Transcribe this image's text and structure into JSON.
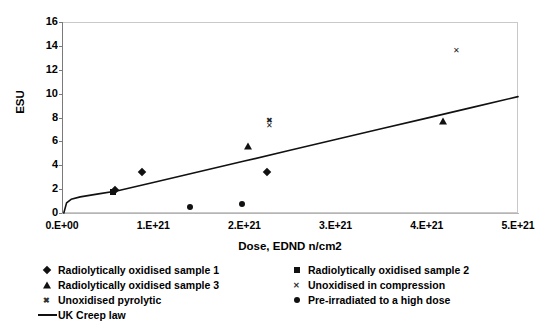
{
  "chart_data": {
    "type": "scatter",
    "title": "",
    "xlabel": "Dose, EDND n/cm2",
    "ylabel": "ESU",
    "xlim": [
      0,
      5e+21
    ],
    "ylim": [
      0,
      16
    ],
    "xticks": [
      "0.E+00",
      "1.E+21",
      "2.E+21",
      "3.E+21",
      "4.E+21",
      "5.E+21"
    ],
    "xtick_values": [
      0,
      1e+21,
      2e+21,
      3e+21,
      4e+21,
      5e+21
    ],
    "yticks": [
      "0",
      "2",
      "4",
      "6",
      "8",
      "10",
      "12",
      "14",
      "16"
    ],
    "ytick_values": [
      0,
      2,
      4,
      6,
      8,
      10,
      12,
      14,
      16
    ],
    "grid": false,
    "legend_position": "bottom",
    "series": [
      {
        "name": "Radiolytically oxidised sample 1",
        "marker": "diamond",
        "points": [
          {
            "x": 5.8e+20,
            "y": 1.95
          },
          {
            "x": 8.8e+20,
            "y": 3.45
          },
          {
            "x": 2.25e+21,
            "y": 3.45
          }
        ]
      },
      {
        "name": "Radiolytically oxidised sample 2",
        "marker": "square",
        "points": [
          {
            "x": 5.6e+20,
            "y": 1.8
          }
        ]
      },
      {
        "name": "Radiolytically oxidised sample 3",
        "marker": "triangle",
        "points": [
          {
            "x": 2.04e+21,
            "y": 5.6
          },
          {
            "x": 4.18e+21,
            "y": 7.7
          }
        ]
      },
      {
        "name": "Unoxidised in compression",
        "marker": "x-thin",
        "points": [
          {
            "x": 2.27e+21,
            "y": 7.35
          },
          {
            "x": 4.33e+21,
            "y": 13.65
          }
        ]
      },
      {
        "name": "Unoxidised pyrolytic",
        "marker": "x-bold",
        "points": [
          {
            "x": 2.27e+21,
            "y": 7.8
          }
        ]
      },
      {
        "name": "Pre-irradiated to a high dose",
        "marker": "circle",
        "points": [
          {
            "x": 1.4e+21,
            "y": 0.5
          },
          {
            "x": 1.97e+21,
            "y": 0.78
          }
        ]
      },
      {
        "name": "UK Creep law",
        "marker": "line",
        "line": [
          {
            "x": 2e+19,
            "y": 0.0
          },
          {
            "x": 5e+19,
            "y": 0.85
          },
          {
            "x": 1e+20,
            "y": 1.15
          },
          {
            "x": 2e+20,
            "y": 1.35
          },
          {
            "x": 4e+20,
            "y": 1.6
          },
          {
            "x": 6e+20,
            "y": 1.85
          },
          {
            "x": 1e+21,
            "y": 2.55
          },
          {
            "x": 1.5e+21,
            "y": 3.45
          },
          {
            "x": 2e+21,
            "y": 4.35
          },
          {
            "x": 2.5e+21,
            "y": 5.25
          },
          {
            "x": 3e+21,
            "y": 6.15
          },
          {
            "x": 3.5e+21,
            "y": 7.05
          },
          {
            "x": 4e+21,
            "y": 7.95
          },
          {
            "x": 4.5e+21,
            "y": 8.85
          },
          {
            "x": 5e+21,
            "y": 9.75
          }
        ]
      }
    ]
  },
  "axes": {
    "y_title": "ESU",
    "x_title": "Dose, EDND n/cm2"
  },
  "legend": {
    "left_items": [
      {
        "label": "Radiolytically oxidised sample 1",
        "key": "diamond-marker-icon"
      },
      {
        "label": "Radiolytically oxidised sample 3",
        "key": "triangle-marker-icon"
      },
      {
        "label": "Unoxidised pyrolytic",
        "key": "x-bold-marker-icon"
      },
      {
        "label": "UK Creep law",
        "key": "line-marker-icon"
      }
    ],
    "right_items": [
      {
        "label": "Radiolytically oxidised sample 2",
        "key": "square-marker-icon"
      },
      {
        "label": "Unoxidised in compression",
        "key": "x-thin-marker-icon"
      },
      {
        "label": "Pre-irradiated to a high dose",
        "key": "circle-marker-icon"
      }
    ]
  },
  "colors": {
    "marker": "#111111",
    "line": "#111111",
    "frame": "#c9c9c9",
    "axis": "#7a7a7a",
    "background": "#ffffff"
  }
}
